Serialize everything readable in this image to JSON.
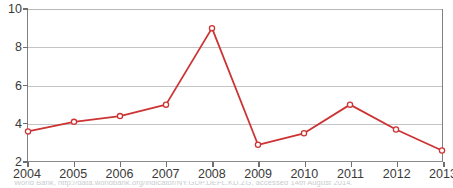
{
  "chart_data": {
    "type": "line",
    "title": "",
    "subtitle": "",
    "xlabel": "",
    "ylabel": "",
    "categories": [
      "2004",
      "2005",
      "2006",
      "2007",
      "2008",
      "2009",
      "2010",
      "2011",
      "2012",
      "2013"
    ],
    "x": [
      2004,
      2005,
      2006,
      2007,
      2008,
      2009,
      2010,
      2011,
      2012,
      2013
    ],
    "values": [
      3.6,
      4.1,
      4.4,
      5.0,
      9.0,
      2.9,
      3.5,
      5.0,
      3.7,
      2.6
    ],
    "series": [
      {
        "name": "",
        "values": [
          3.6,
          4.1,
          4.4,
          5.0,
          9.0,
          2.9,
          3.5,
          5.0,
          3.7,
          2.6
        ]
      }
    ],
    "ylim": [
      2,
      10
    ],
    "xlim": [
      2004,
      2013
    ],
    "yticks": [
      2,
      4,
      6,
      8,
      10
    ],
    "ytick_labels": [
      "2",
      "4",
      "6",
      "8",
      "10"
    ],
    "xticks": [
      2004,
      2005,
      2006,
      2007,
      2008,
      2009,
      2010,
      2011,
      2012,
      2013
    ],
    "xtick_labels": [
      "2004",
      "2005",
      "2006",
      "2007",
      "2008",
      "2009",
      "2010",
      "2011",
      "2012",
      "2013"
    ],
    "grid": true,
    "grid_axis": "y",
    "legend": false,
    "legend_position": "none",
    "marker": "open-circle",
    "annotations": []
  },
  "style": {
    "line_color": "#cc3333",
    "marker_fill": "#ffffff",
    "marker_stroke": "#cc3333",
    "grid_color": "#c4c4c4",
    "axis_color": "#808080",
    "tick_color": "#6e6e6e",
    "label_color": "#3a3a3a",
    "plot_background": "#ffffff",
    "page_background": "#ffffff",
    "caption_color": "#9aa0a6"
  },
  "caption": {
    "text": "World Bank, http://data.worldbank.org/indicator/NY.GDP.DEFL.KD.ZG, accessed 14th August 2014."
  }
}
